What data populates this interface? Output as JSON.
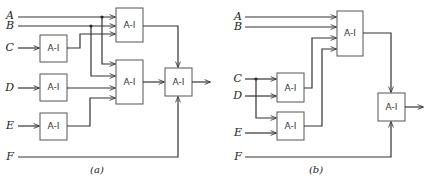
{
  "diagrams": {
    "a": {
      "caption": "(a)",
      "inputs": {
        "A": "A",
        "B": "B",
        "C": "C",
        "D": "D",
        "E": "E",
        "F": "F"
      },
      "blocks": {
        "c_block": "A-I",
        "d_block": "A-I",
        "e_block": "A-I",
        "top_block": "A-I",
        "mid_block": "A-I",
        "out_block": "A-I"
      }
    },
    "b": {
      "caption": "(b)",
      "inputs": {
        "A": "A",
        "B": "B",
        "C": "C",
        "D": "D",
        "E": "E",
        "F": "F"
      },
      "blocks": {
        "top_block": "A-I",
        "cd_block": "A-I",
        "e_block": "A-I",
        "out_block": "A-I"
      }
    }
  },
  "colors": {
    "line": "#333333",
    "box": "#555555"
  }
}
